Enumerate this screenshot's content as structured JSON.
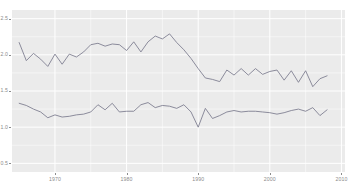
{
  "chart_data": {
    "type": "line",
    "title": "",
    "subtitle": "",
    "xlabel": "",
    "ylabel": "",
    "xlim": [
      1964,
      2010.5
    ],
    "ylim": [
      0.38,
      2.62
    ],
    "grid": true,
    "grid_style": "white gridlines on gray panel",
    "legend": "none",
    "panel_background": "#ebebeb",
    "line_color": "#7a7a8c",
    "gridline_color": "#ffffff",
    "axis_text_color": "#8c8c8c",
    "y_ticks": [
      0.5,
      1.0,
      1.5,
      2.0,
      2.5
    ],
    "y_tick_labels": [
      "0.5",
      "1.0",
      "1.5",
      "2.0",
      "2.5"
    ],
    "x_ticks": [
      1970,
      1980,
      1990,
      2000,
      2010
    ],
    "x_tick_labels": [
      "1970",
      "1980",
      "1990",
      "2000",
      "2010"
    ],
    "x": [
      1965,
      1966,
      1967,
      1968,
      1969,
      1970,
      1971,
      1972,
      1973,
      1974,
      1975,
      1976,
      1977,
      1978,
      1979,
      1980,
      1981,
      1982,
      1983,
      1984,
      1985,
      1986,
      1987,
      1988,
      1989,
      1990,
      1991,
      1992,
      1993,
      1994,
      1995,
      1996,
      1997,
      1998,
      1999,
      2000,
      2001,
      2002,
      2003,
      2004,
      2005,
      2006,
      2007,
      2008
    ],
    "series": [
      {
        "name": "upper-series",
        "color": "#7a7a8c",
        "values": [
          2.17,
          1.92,
          2.02,
          1.94,
          1.84,
          2.01,
          1.87,
          2.01,
          1.97,
          2.04,
          2.14,
          2.16,
          2.12,
          2.15,
          2.14,
          2.06,
          2.18,
          2.04,
          2.18,
          2.26,
          2.22,
          2.29,
          2.17,
          2.07,
          1.95,
          1.81,
          1.68,
          1.66,
          1.63,
          1.79,
          1.72,
          1.81,
          1.72,
          1.81,
          1.73,
          1.77,
          1.79,
          1.65,
          1.78,
          1.62,
          1.78,
          1.56,
          1.67,
          1.71
        ]
      },
      {
        "name": "lower-series",
        "color": "#7a7a8c",
        "values": [
          1.33,
          1.3,
          1.25,
          1.21,
          1.13,
          1.17,
          1.14,
          1.15,
          1.17,
          1.18,
          1.21,
          1.31,
          1.24,
          1.33,
          1.21,
          1.22,
          1.22,
          1.31,
          1.34,
          1.27,
          1.3,
          1.29,
          1.26,
          1.31,
          1.21,
          1.0,
          1.26,
          1.12,
          1.16,
          1.21,
          1.23,
          1.21,
          1.22,
          1.22,
          1.21,
          1.2,
          1.18,
          1.2,
          1.23,
          1.25,
          1.22,
          1.27,
          1.16,
          1.24
        ]
      }
    ]
  }
}
